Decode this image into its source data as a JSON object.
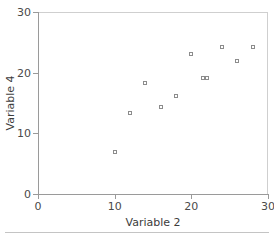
{
  "chart_data": {
    "type": "scatter",
    "title": "",
    "xlabel": "Variable 2",
    "ylabel": "Variable 4",
    "xlim": [
      0,
      30
    ],
    "ylim": [
      0,
      30
    ],
    "xticks": [
      0,
      10,
      20,
      30
    ],
    "yticks": [
      0,
      10,
      20,
      30
    ],
    "xticklabels": [
      "0",
      "10",
      "20",
      "30"
    ],
    "yticklabels": [
      "0",
      "10",
      "20",
      "30"
    ],
    "grid": false,
    "legend": null,
    "marker": "open-square",
    "marker_color": "#8c8c8c",
    "points": [
      {
        "x": 10,
        "y": 7
      },
      {
        "x": 12,
        "y": 13.3
      },
      {
        "x": 14,
        "y": 18.3
      },
      {
        "x": 16,
        "y": 14.3
      },
      {
        "x": 18,
        "y": 16.2
      },
      {
        "x": 20,
        "y": 23
      },
      {
        "x": 21.5,
        "y": 19.1
      },
      {
        "x": 22,
        "y": 19.1
      },
      {
        "x": 24,
        "y": 24.2
      },
      {
        "x": 26,
        "y": 22
      },
      {
        "x": 28,
        "y": 24.2
      }
    ]
  },
  "colors": {
    "axis": "#9a9a9a",
    "frame": "#cfcfcf",
    "text": "#4a4a4a",
    "marker": "#8c8c8c",
    "background": "#ffffff"
  }
}
